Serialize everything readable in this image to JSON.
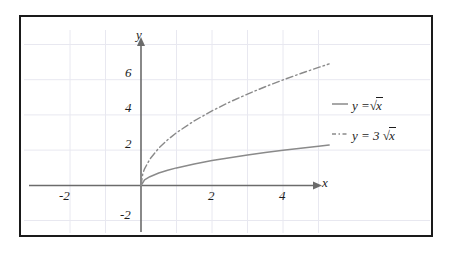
{
  "figure": {
    "background": "#ffffff",
    "frame_color": "#1a1a1a"
  },
  "chart_data": {
    "type": "line",
    "title": "",
    "xlabel": "x",
    "ylabel": "y",
    "xlim": [
      -3,
      5.4
    ],
    "ylim": [
      -2.8,
      7.6
    ],
    "grid": true,
    "grid_color": "#e6e6ee",
    "axis_color": "#6b6b6b",
    "legend_position": "right",
    "x_ticks": [
      -2,
      2,
      4
    ],
    "x_tick_labels": [
      "-2",
      "2",
      "4"
    ],
    "y_ticks": [
      6,
      4,
      2,
      -2
    ],
    "y_tick_labels": [
      "6",
      "4",
      "2",
      "-2"
    ],
    "series": [
      {
        "name": "y = √x",
        "legend_label_parts": {
          "lhs": "y =",
          "coefficient": "",
          "radical": "√",
          "radicand": "x"
        },
        "style": "solid",
        "color": "#8a8a8a",
        "domain": [
          0,
          5.3
        ],
        "formula": "sqrt(x)",
        "points": [
          [
            0,
            0
          ],
          [
            0.1,
            0.316
          ],
          [
            0.25,
            0.5
          ],
          [
            0.5,
            0.707
          ],
          [
            0.75,
            0.866
          ],
          [
            1,
            1
          ],
          [
            1.5,
            1.225
          ],
          [
            2,
            1.414
          ],
          [
            2.5,
            1.581
          ],
          [
            3,
            1.732
          ],
          [
            3.5,
            1.871
          ],
          [
            4,
            2
          ],
          [
            4.5,
            2.121
          ],
          [
            5,
            2.236
          ],
          [
            5.3,
            2.302
          ]
        ]
      },
      {
        "name": "y = 3√x",
        "legend_label_parts": {
          "lhs": "y =",
          "coefficient": "3",
          "radical": "√",
          "radicand": "x"
        },
        "style": "dash-dot",
        "color": "#8a8a8a",
        "domain": [
          0,
          5.3
        ],
        "formula": "3*sqrt(x)",
        "points": [
          [
            0,
            0
          ],
          [
            0.05,
            0.671
          ],
          [
            0.1,
            0.949
          ],
          [
            0.25,
            1.5
          ],
          [
            0.5,
            2.121
          ],
          [
            0.75,
            2.598
          ],
          [
            1,
            3
          ],
          [
            1.5,
            3.674
          ],
          [
            2,
            4.243
          ],
          [
            2.5,
            4.743
          ],
          [
            3,
            5.196
          ],
          [
            3.5,
            5.612
          ],
          [
            4,
            6
          ],
          [
            4.5,
            6.364
          ],
          [
            5,
            6.708
          ],
          [
            5.3,
            6.907
          ]
        ]
      }
    ]
  },
  "axes": {
    "x_axis_name": "x-axis",
    "y_axis_name": "y-axis",
    "x_arrow": true,
    "y_arrow": true
  }
}
